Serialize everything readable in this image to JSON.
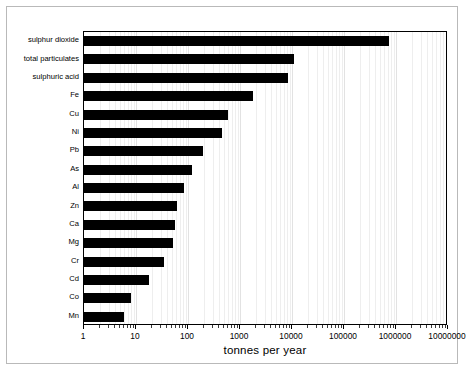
{
  "chart_data": {
    "type": "bar",
    "orientation": "horizontal",
    "title": "",
    "xlabel": "tonnes per year",
    "ylabel": "",
    "xscale": "log",
    "xlim": [
      1,
      10000000
    ],
    "grid": true,
    "legend": null,
    "categories": [
      "sulphur dioxide",
      "total particulates",
      "sulphuric acid",
      "Fe",
      "Cu",
      "Ni",
      "Pb",
      "As",
      "Al",
      "Zn",
      "Ca",
      "Mg",
      "Cr",
      "Cd",
      "Co",
      "Mn"
    ],
    "values": [
      740000,
      11000,
      8500,
      1800,
      580,
      450,
      190,
      120,
      85,
      62,
      55,
      52,
      34,
      18,
      8,
      6
    ],
    "xticks": [
      1,
      10,
      100,
      1000,
      10000,
      100000,
      1000000,
      10000000
    ],
    "xtick_labels": [
      "1",
      "10",
      "100",
      "1000",
      "10000",
      "100000",
      "1000000",
      "10000000"
    ],
    "bar_color": "#000000",
    "plot_background": "#ffffff"
  },
  "figure": {
    "frame_color": "#b9b9b9",
    "axis_color": "#000000",
    "grid_color": "#e2e2e2"
  }
}
